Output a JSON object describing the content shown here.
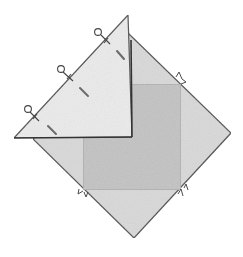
{
  "figure": {
    "description": "Pencil-style quilting diagram: a square-on-point fabric block with a triangle folded over the upper-left half, pinned along the folded edge, with a darker inner square and small notch markers.",
    "colors": {
      "background": "#ffffff",
      "diamond_fill": "#d9d9d9",
      "inner_square_fill": "#c3c3c3",
      "triangle_fill": "#ebebeb",
      "outline": "#4a4a4a",
      "pin": "#444444",
      "stitch_mark": "#6a6a6a"
    },
    "parts": {
      "diamond": "square-on-point block",
      "inner_square": "center square",
      "folded_triangle": "folded triangle flap",
      "pins": [
        "pin 1",
        "pin 2",
        "pin 3"
      ],
      "stitch_marks": [
        "stitch mark 1",
        "stitch mark 2",
        "stitch mark 3"
      ],
      "notches": [
        "notch top-right",
        "notch bottom-left",
        "notch bottom-right"
      ]
    }
  }
}
